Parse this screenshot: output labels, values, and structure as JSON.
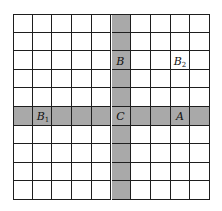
{
  "diagram": {
    "rows": 10,
    "cols": 10,
    "shaded_row": 5,
    "shaded_col": 5,
    "colors": {
      "shade": "#a9a9a9",
      "line": "#1e1e1e",
      "background": "#ffffff"
    },
    "labels": [
      {
        "id": "B",
        "base": "B",
        "sub": "",
        "row": 2,
        "col": 5
      },
      {
        "id": "B2",
        "base": "B",
        "sub": "2",
        "row": 2,
        "col": 8
      },
      {
        "id": "B1",
        "base": "B",
        "sub": "1",
        "row": 5,
        "col": 1
      },
      {
        "id": "C",
        "base": "C",
        "sub": "",
        "row": 5,
        "col": 5
      },
      {
        "id": "A",
        "base": "A",
        "sub": "",
        "row": 5,
        "col": 8
      }
    ]
  }
}
